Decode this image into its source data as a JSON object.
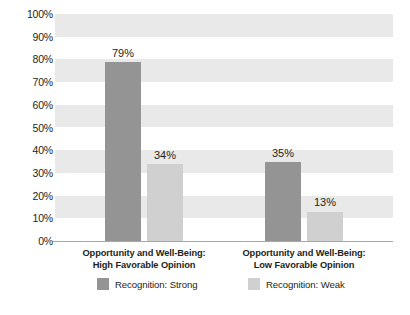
{
  "chart_data": {
    "type": "bar",
    "title": "",
    "xlabel": "",
    "ylabel": "",
    "ylim": [
      0,
      100
    ],
    "grid": "horizontal-bands",
    "legend_position": "bottom",
    "categories": [
      "Opportunity and Well-Being:\nHigh Favorable Opinion",
      "Opportunity and Well-Being:\nLow Favorable Opinion"
    ],
    "category_lines": [
      [
        "Opportunity and Well-Being:",
        "High Favorable Opinion"
      ],
      [
        "Opportunity and Well-Being:",
        "Low Favorable Opinion"
      ]
    ],
    "series": [
      {
        "name": "Recognition: Strong",
        "color": "#949494",
        "values": [
          79,
          34
        ],
        "labels": [
          "79%",
          "34%"
        ]
      },
      {
        "name": "Recognition: Weak",
        "color": "#d0d0d0",
        "values": [
          34,
          13
        ],
        "labels": [
          "34%",
          "13%"
        ]
      }
    ],
    "bars": [
      {
        "category_index": 0,
        "series": "Recognition: Strong",
        "value": 79,
        "label": "79%"
      },
      {
        "category_index": 0,
        "series": "Recognition: Weak",
        "value": 34,
        "label": "34%"
      },
      {
        "category_index": 1,
        "series": "Recognition: Strong",
        "value": 35,
        "label": "35%"
      },
      {
        "category_index": 1,
        "series": "Recognition: Weak",
        "value": 13,
        "label": "13%"
      }
    ],
    "ytick_labels": [
      "100%",
      "90%",
      "80%",
      "70%",
      "60%",
      "50%",
      "40%",
      "30%",
      "20%",
      "10%",
      "0%"
    ],
    "ytick_values": [
      100,
      90,
      80,
      70,
      60,
      50,
      40,
      30,
      20,
      10,
      0
    ]
  },
  "legend": {
    "items": [
      {
        "label": "Recognition: Strong",
        "color": "#949494"
      },
      {
        "label": "Recognition: Weak",
        "color": "#d0d0d0"
      }
    ]
  },
  "colors": {
    "strong": "#949494",
    "weak": "#d0d0d0",
    "band": "#e9e9e9",
    "axis": "#a8a8a8",
    "text": "#231f20",
    "background": "#ffffff"
  }
}
